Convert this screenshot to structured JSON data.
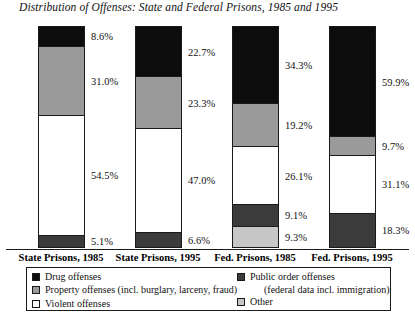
{
  "title": "Distribution of Offenses: State and Federal Prisons, 1985 and 1995",
  "colors": {
    "drug": "#0d0d0d",
    "property": "#9a9a9a",
    "violent": "#ffffff",
    "public_order": "#3b3b3b",
    "other": "#c6c6c6",
    "outline": "#1a1a1a"
  },
  "legend": {
    "left": [
      {
        "label": "Drug offenses",
        "key": "drug"
      },
      {
        "label": "Property offenses (incl. burglary, larceny, fraud)",
        "key": "property"
      },
      {
        "label": "Violent offenses",
        "key": "violent"
      }
    ],
    "right": [
      {
        "label": "Public order offenses",
        "key": "public_order"
      },
      {
        "label": "Other",
        "key": "other"
      }
    ],
    "right_subnote": "(federal data incl. immigration)"
  },
  "chart_data": {
    "type": "bar",
    "subtype": "stacked-bar",
    "title": "Distribution of Offenses: State and Federal Prisons, 1985 and 1995",
    "xlabel": "",
    "ylabel": "",
    "grid": false,
    "legend_position": "bottom",
    "categories": [
      "State Prisons, 1985",
      "State Prisons, 1995",
      "Fed. Prisons, 1985",
      "Fed. Prisons, 1995"
    ],
    "series": [
      {
        "name": "Drug offenses",
        "values": [
          8.6,
          22.7,
          34.3,
          59.9
        ]
      },
      {
        "name": "Property offenses (incl. burglary, larceny, fraud)",
        "values": [
          31.0,
          23.3,
          19.2,
          9.7
        ]
      },
      {
        "name": "Violent offenses",
        "values": [
          54.5,
          47.0,
          26.1,
          31.1
        ]
      },
      {
        "name": "Public order offenses",
        "values": [
          5.1,
          6.6,
          9.1,
          18.3
        ]
      },
      {
        "name": "Other",
        "values": [
          null,
          null,
          9.3,
          null
        ]
      }
    ],
    "bars": [
      {
        "category": "State Prisons, 1985",
        "segments": [
          {
            "key": "drug",
            "label": "8.6%",
            "value": 8.6
          },
          {
            "key": "property",
            "label": "31.0%",
            "value": 31.0
          },
          {
            "key": "violent",
            "label": "54.5%",
            "value": 54.5
          },
          {
            "key": "public_order",
            "label": "5.1%",
            "value": 5.1
          }
        ]
      },
      {
        "category": "State Prisons, 1995",
        "segments": [
          {
            "key": "drug",
            "label": "22.7%",
            "value": 22.7
          },
          {
            "key": "property",
            "label": "23.3%",
            "value": 23.3
          },
          {
            "key": "violent",
            "label": "47.0%",
            "value": 47.0
          },
          {
            "key": "public_order",
            "label": "6.6%",
            "value": 6.6
          }
        ]
      },
      {
        "category": "Fed. Prisons, 1985",
        "segments": [
          {
            "key": "drug",
            "label": "34.3%",
            "value": 34.3
          },
          {
            "key": "property",
            "label": "19.2%",
            "value": 19.2
          },
          {
            "key": "violent",
            "label": "26.1%",
            "value": 26.1
          },
          {
            "key": "public_order",
            "label": "9.1%",
            "value": 9.1
          },
          {
            "key": "other",
            "label": "9.3%",
            "value": 9.3
          }
        ]
      },
      {
        "category": "Fed. Prisons, 1995",
        "segments": [
          {
            "key": "drug",
            "label": "59.9%",
            "value": 59.9
          },
          {
            "key": "property",
            "label": "9.7%",
            "value": 9.7
          },
          {
            "key": "violent",
            "label": "31.1%",
            "value": 31.1
          },
          {
            "key": "public_order",
            "label": "18.3%",
            "value": 18.3
          }
        ]
      }
    ]
  }
}
